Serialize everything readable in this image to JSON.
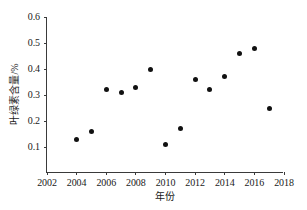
{
  "chart_data": {
    "type": "scatter",
    "title": "",
    "xlabel": "年份",
    "ylabel": "叶绿素含量/%",
    "xlim": [
      2002,
      2018
    ],
    "ylim": [
      0,
      0.6
    ],
    "grid": false,
    "legend": null,
    "xticks": [
      2002,
      2004,
      2006,
      2008,
      2010,
      2012,
      2014,
      2016,
      2018
    ],
    "xtick_labels": [
      "2002",
      "2004",
      "2006",
      "2008",
      "2010",
      "2012",
      "2014",
      "2016",
      "2018"
    ],
    "yticks": [
      0.1,
      0.2,
      0.3,
      0.4,
      0.5,
      0.6
    ],
    "ytick_labels": [
      "0.1",
      "0.2",
      "0.3",
      "0.4",
      "0.5",
      "0.6"
    ],
    "marker": "filled-circle",
    "marker_color": "#111111",
    "axis_color": "#3a3a3a",
    "background": "#ffffff",
    "x": [
      2004,
      2005,
      2006,
      2007,
      2008,
      2009,
      2010,
      2011,
      2012,
      2013,
      2014,
      2015,
      2016,
      2017
    ],
    "y": [
      0.13,
      0.16,
      0.32,
      0.31,
      0.33,
      0.4,
      0.11,
      0.17,
      0.36,
      0.32,
      0.37,
      0.46,
      0.48,
      0.25
    ],
    "points": [
      {
        "x": 2004,
        "y": 0.13
      },
      {
        "x": 2005,
        "y": 0.16
      },
      {
        "x": 2006,
        "y": 0.32
      },
      {
        "x": 2007,
        "y": 0.31
      },
      {
        "x": 2008,
        "y": 0.33
      },
      {
        "x": 2009,
        "y": 0.4
      },
      {
        "x": 2010,
        "y": 0.11
      },
      {
        "x": 2011,
        "y": 0.17
      },
      {
        "x": 2012,
        "y": 0.36
      },
      {
        "x": 2013,
        "y": 0.32
      },
      {
        "x": 2014,
        "y": 0.37
      },
      {
        "x": 2015,
        "y": 0.46
      },
      {
        "x": 2016,
        "y": 0.48
      },
      {
        "x": 2017,
        "y": 0.25
      }
    ]
  }
}
